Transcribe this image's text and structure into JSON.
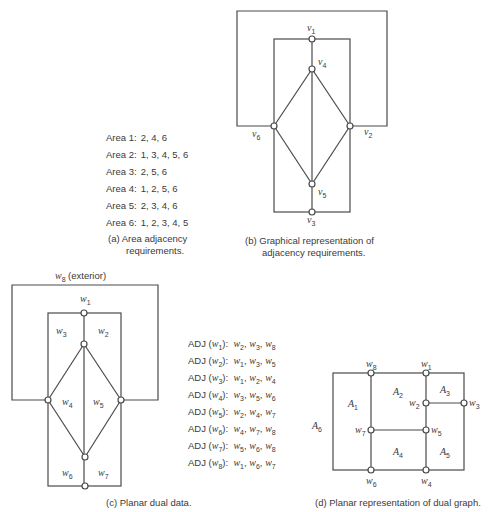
{
  "panel_a": {
    "rows": [
      {
        "area": "Area 1:",
        "adj": "2, 4, 6"
      },
      {
        "area": "Area 2:",
        "adj": "1, 3, 4, 5, 6"
      },
      {
        "area": "Area 3:",
        "adj": "2, 5, 6"
      },
      {
        "area": "Area 4:",
        "adj": "1, 2, 5, 6"
      },
      {
        "area": "Area 5:",
        "adj": "2, 3, 4, 6"
      },
      {
        "area": "Area 6:",
        "adj": "1, 2, 3, 4, 5"
      }
    ],
    "caption_line1": "(a)  Area adjacency",
    "caption_line2": "requirements."
  },
  "panel_b": {
    "nodes": {
      "v1": {
        "name": "v",
        "sub": "1"
      },
      "v2": {
        "name": "v",
        "sub": "2"
      },
      "v3": {
        "name": "v",
        "sub": "3"
      },
      "v4": {
        "name": "v",
        "sub": "4"
      },
      "v5": {
        "name": "v",
        "sub": "5"
      },
      "v6": {
        "name": "v",
        "sub": "6"
      }
    },
    "caption_line1": "(b)  Graphical representation of",
    "caption_line2": "adjacency requirements."
  },
  "panel_c": {
    "exterior_label": "(exterior)",
    "faces": {
      "w1": {
        "name": "w",
        "sub": "1"
      },
      "w2": {
        "name": "w",
        "sub": "2"
      },
      "w3": {
        "name": "w",
        "sub": "3"
      },
      "w4": {
        "name": "w",
        "sub": "4"
      },
      "w5": {
        "name": "w",
        "sub": "5"
      },
      "w6": {
        "name": "w",
        "sub": "6"
      },
      "w7": {
        "name": "w",
        "sub": "7"
      },
      "w8": {
        "name": "w",
        "sub": "8"
      }
    },
    "caption": "(c)  Planar dual data."
  },
  "adjacency_list": {
    "rows": [
      {
        "prefix": "ADJ (",
        "node": "w",
        "sub": "1",
        "items": [
          [
            "w",
            "2"
          ],
          [
            "w",
            "3"
          ],
          [
            "w",
            "8"
          ]
        ]
      },
      {
        "prefix": "ADJ (",
        "node": "w",
        "sub": "2",
        "items": [
          [
            "w",
            "1"
          ],
          [
            "w",
            "3"
          ],
          [
            "w",
            "5"
          ]
        ]
      },
      {
        "prefix": "ADJ (",
        "node": "w",
        "sub": "3",
        "items": [
          [
            "w",
            "1"
          ],
          [
            "w",
            "2"
          ],
          [
            "w",
            "4"
          ]
        ]
      },
      {
        "prefix": "ADJ (",
        "node": "w",
        "sub": "4",
        "items": [
          [
            "w",
            "3"
          ],
          [
            "w",
            "5"
          ],
          [
            "w",
            "6"
          ]
        ]
      },
      {
        "prefix": "ADJ (",
        "node": "w",
        "sub": "5",
        "items": [
          [
            "w",
            "2"
          ],
          [
            "w",
            "4"
          ],
          [
            "w",
            "7"
          ]
        ]
      },
      {
        "prefix": "ADJ (",
        "node": "w",
        "sub": "6",
        "items": [
          [
            "w",
            "4"
          ],
          [
            "w",
            "7"
          ],
          [
            "w",
            "8"
          ]
        ]
      },
      {
        "prefix": "ADJ (",
        "node": "w",
        "sub": "7",
        "items": [
          [
            "w",
            "5"
          ],
          [
            "w",
            "6"
          ],
          [
            "w",
            "8"
          ]
        ]
      },
      {
        "prefix": "ADJ (",
        "node": "w",
        "sub": "8",
        "items": [
          [
            "w",
            "1"
          ],
          [
            "w",
            "6"
          ],
          [
            "w",
            "7"
          ]
        ]
      }
    ]
  },
  "panel_d": {
    "nodes": {
      "w1": {
        "name": "w",
        "sub": "1"
      },
      "w2": {
        "name": "w",
        "sub": "2"
      },
      "w3": {
        "name": "w",
        "sub": "3"
      },
      "w4": {
        "name": "w",
        "sub": "4"
      },
      "w5": {
        "name": "w",
        "sub": "5"
      },
      "w6": {
        "name": "w",
        "sub": "6"
      },
      "w7": {
        "name": "w",
        "sub": "7"
      },
      "w8": {
        "name": "w",
        "sub": "8"
      }
    },
    "areas": {
      "A1": {
        "name": "A",
        "sub": "1"
      },
      "A2": {
        "name": "A",
        "sub": "2"
      },
      "A3": {
        "name": "A",
        "sub": "3"
      },
      "A4": {
        "name": "A",
        "sub": "4"
      },
      "A5": {
        "name": "A",
        "sub": "5"
      },
      "A6": {
        "name": "A",
        "sub": "6"
      }
    },
    "caption": "(d)  Planar representation of dual graph."
  }
}
